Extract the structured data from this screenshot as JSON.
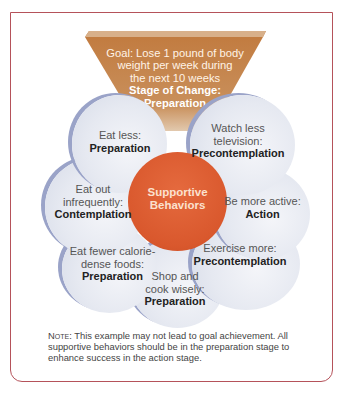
{
  "header": {
    "cut_text": "Setting Supportive..."
  },
  "goal": {
    "line1": "Goal: Lose 1 pound of body",
    "line2": "weight per week during",
    "line3": "the next 10 weeks",
    "stage_label": "Stage of Change:",
    "stage_value": "Preparation"
  },
  "center": {
    "line1": "Supportive",
    "line2": "Behaviors",
    "color": "#d9582d"
  },
  "behaviors": [
    {
      "text1": "Eat less:",
      "text2": "",
      "stage": "Preparation"
    },
    {
      "text1": "Watch less",
      "text2": "television:",
      "stage": "Precontemplation"
    },
    {
      "text1": "Eat out",
      "text2": "infrequently:",
      "stage": "Contemplation"
    },
    {
      "text1": "Be more active:",
      "text2": "",
      "stage": "Action"
    },
    {
      "text1": "Eat fewer calorie-",
      "text2": "dense foods:",
      "stage": "Preparation"
    },
    {
      "text1": "Exercise more:",
      "text2": "",
      "stage": "Precontemplation"
    },
    {
      "text1": "Shop and",
      "text2": "cook wisely:",
      "stage": "Preparation"
    }
  ],
  "note": {
    "label": "Note:",
    "text": " This example may not lead to goal achievement. All supportive behaviors should be in the preparation stage to enhance success in the action stage."
  },
  "colors": {
    "frame": "#b5525a",
    "funnel": "#c27a3f",
    "bubble": "#e6e9f1",
    "bubble_edge": "#9aa3c8"
  }
}
